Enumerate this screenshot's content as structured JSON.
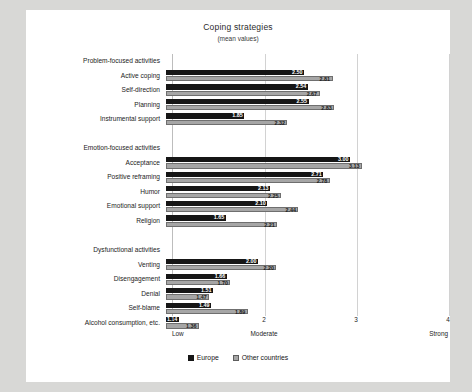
{
  "chart_data": {
    "type": "bar",
    "orientation": "horizontal",
    "title": "Coping strategies",
    "subtitle": "(mean values)",
    "xlabel": "",
    "ylabel": "",
    "xlim": [
      1,
      4
    ],
    "xticks": [
      1,
      2,
      3,
      4
    ],
    "xtick_labels": [
      "1",
      "2",
      "3",
      "4"
    ],
    "scale_anchors": [
      {
        "value": 1,
        "label": "Low"
      },
      {
        "value": 2,
        "label": "Moderate"
      },
      {
        "value": 4,
        "label": "Strong"
      }
    ],
    "grid": true,
    "legend_position": "bottom",
    "legend": [
      "Europe",
      "Other countries"
    ],
    "colors": {
      "europe": "#161616",
      "other": "#a6a6a6",
      "background": "#ffffff"
    },
    "groups": [
      {
        "name": "Problem-focused activities",
        "categories": [
          "Active coping",
          "Self-direction",
          "Planning",
          "Instrumental support"
        ],
        "series": [
          {
            "name": "Europe",
            "values": [
              2.5,
              2.54,
              2.55,
              1.85
            ]
          },
          {
            "name": "Other countries",
            "values": [
              2.81,
              2.67,
              2.83,
              2.32
            ]
          }
        ]
      },
      {
        "name": "Emotion-focused activities",
        "categories": [
          "Acceptance",
          "Positive reframing",
          "Humor",
          "Emotional support",
          "Religion"
        ],
        "series": [
          {
            "name": "Europe",
            "values": [
              3.0,
              2.71,
              2.13,
              2.1,
              1.65
            ]
          },
          {
            "name": "Other countries",
            "values": [
              3.13,
              2.78,
              2.25,
              2.44,
              2.21
            ]
          }
        ]
      },
      {
        "name": "Dysfunctional activities",
        "categories": [
          "Venting",
          "Disengagement",
          "Denial",
          "Self-blame",
          "Alcohol consumption, etc."
        ],
        "series": [
          {
            "name": "Europe",
            "values": [
              2.0,
              1.66,
              1.51,
              1.49,
              1.14
            ]
          },
          {
            "name": "Other countries",
            "values": [
              2.2,
              1.7,
              1.47,
              1.89,
              1.36
            ]
          }
        ]
      }
    ]
  }
}
